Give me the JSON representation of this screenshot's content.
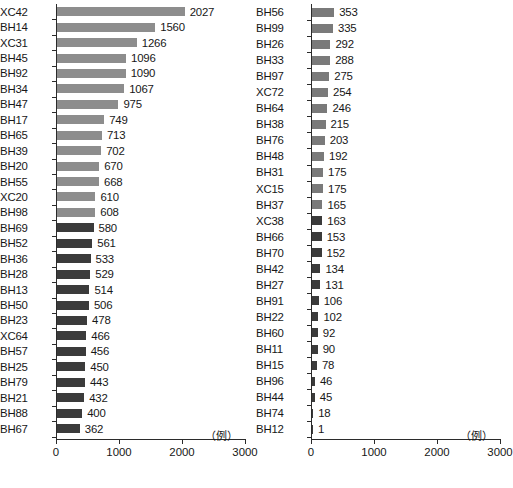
{
  "chart_data": {
    "type": "bar",
    "orientation": "horizontal",
    "title": "",
    "xlabel": "",
    "ylabel": "",
    "unit_label": "（例）",
    "xlim": [
      0,
      3000
    ],
    "xticks": [
      0,
      1000,
      2000,
      3000
    ],
    "xticklabels": [
      "0",
      "1000",
      "2000",
      "3000"
    ],
    "grid": false,
    "legend": "none",
    "colors": {
      "tier1": "#8d8d8d",
      "tier2": "#7a7a7a",
      "tier3": "#3b3b3b",
      "axis": "#2b2b2b",
      "text": "#171717",
      "background": "#ffffff"
    },
    "panels": [
      {
        "name": "left-panel",
        "categories": [
          "XC42",
          "BH14",
          "XC31",
          "BH45",
          "BH92",
          "BH34",
          "BH47",
          "BH17",
          "BH65",
          "BH39",
          "BH20",
          "BH55",
          "XC20",
          "BH98",
          "BH69",
          "BH52",
          "BH36",
          "BH28",
          "BH13",
          "BH50",
          "BH23",
          "XC64",
          "BH57",
          "BH25",
          "BH79",
          "BH21",
          "BH88",
          "BH67"
        ],
        "values": [
          2027,
          1560,
          1266,
          1096,
          1090,
          1067,
          975,
          749,
          713,
          702,
          670,
          668,
          610,
          608,
          580,
          561,
          533,
          529,
          514,
          506,
          478,
          466,
          456,
          450,
          443,
          432,
          400,
          362
        ],
        "tiers": [
          "tier1",
          "tier1",
          "tier1",
          "tier1",
          "tier1",
          "tier1",
          "tier1",
          "tier1",
          "tier1",
          "tier1",
          "tier1",
          "tier1",
          "tier1",
          "tier1",
          "tier3",
          "tier3",
          "tier3",
          "tier3",
          "tier3",
          "tier3",
          "tier3",
          "tier3",
          "tier3",
          "tier3",
          "tier3",
          "tier3",
          "tier3",
          "tier3"
        ]
      },
      {
        "name": "right-panel",
        "categories": [
          "BH56",
          "BH99",
          "BH26",
          "BH33",
          "BH97",
          "XC72",
          "BH64",
          "BH38",
          "BH76",
          "BH48",
          "BH31",
          "XC15",
          "BH37",
          "XC38",
          "BH66",
          "BH70",
          "BH42",
          "BH27",
          "BH91",
          "BH22",
          "BH60",
          "BH11",
          "BH15",
          "BH96",
          "BH44",
          "BH74",
          "BH12"
        ],
        "values": [
          353,
          335,
          292,
          288,
          275,
          254,
          246,
          215,
          203,
          192,
          175,
          175,
          165,
          163,
          153,
          152,
          134,
          131,
          106,
          102,
          92,
          90,
          78,
          46,
          45,
          18,
          1
        ],
        "tiers": [
          "tier2",
          "tier2",
          "tier2",
          "tier2",
          "tier2",
          "tier2",
          "tier2",
          "tier2",
          "tier2",
          "tier2",
          "tier2",
          "tier2",
          "tier2",
          "tier3",
          "tier3",
          "tier3",
          "tier3",
          "tier3",
          "tier3",
          "tier3",
          "tier3",
          "tier3",
          "tier3",
          "tier3",
          "tier3",
          "tier3",
          "tier3"
        ]
      }
    ]
  }
}
